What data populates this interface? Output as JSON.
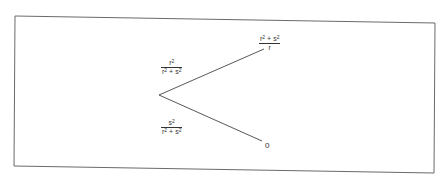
{
  "diagram": {
    "type": "probability-tree",
    "root": {
      "x": 159,
      "y": 95
    },
    "branches": [
      {
        "id": "upper",
        "end": {
          "x": 264,
          "y": 49
        },
        "probability": {
          "numerator": "r",
          "numerator_sup": "2",
          "denominator": "r",
          "denominator_sup1": "2",
          "op": "+",
          "denominator_var2": "s",
          "denominator_sup2": "2"
        },
        "outcome": {
          "numerator": "r",
          "numerator_sup1": "2",
          "op": "+",
          "numerator_var2": "s",
          "numerator_sup2": "2",
          "denominator": "r"
        }
      },
      {
        "id": "lower",
        "end": {
          "x": 262,
          "y": 141
        },
        "probability": {
          "numerator": "s",
          "numerator_sup": "2",
          "denominator": "r",
          "denominator_sup1": "2",
          "op": "+",
          "denominator_var2": "s",
          "denominator_sup2": "2"
        },
        "outcome": {
          "value": "0"
        }
      }
    ],
    "colors": {
      "line": "#444444",
      "border": "#666666",
      "text": "#333333",
      "background": "#ffffff"
    }
  }
}
